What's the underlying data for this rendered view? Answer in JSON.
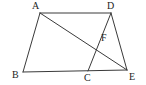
{
  "figure": {
    "width": 146,
    "height": 85,
    "background_color": "#ffffff",
    "stroke_color": "#3a3a3a",
    "label_color": "#232323",
    "stroke_width": 1
  },
  "chart_data": {
    "type": "diagram",
    "title": "",
    "points": [
      {
        "id": "A",
        "label": "A",
        "x": 40,
        "y": 13,
        "label_x": 32,
        "label_y": 1
      },
      {
        "id": "D",
        "label": "D",
        "x": 111,
        "y": 13,
        "label_x": 107,
        "label_y": 1
      },
      {
        "id": "B",
        "label": "B",
        "x": 23,
        "y": 72,
        "label_x": 12,
        "label_y": 70
      },
      {
        "id": "C",
        "label": "C",
        "x": 88,
        "y": 71,
        "label_x": 84,
        "label_y": 73
      },
      {
        "id": "E",
        "label": "E",
        "x": 127,
        "y": 70,
        "label_x": 129,
        "label_y": 72
      },
      {
        "id": "F",
        "label": "F",
        "x": 100,
        "y": 42,
        "label_x": 101,
        "label_y": 33
      }
    ],
    "segments": [
      {
        "name": "AD",
        "from": "A",
        "to": "D"
      },
      {
        "name": "AB",
        "from": "A",
        "to": "B"
      },
      {
        "name": "BE",
        "from": "B",
        "to": "E"
      },
      {
        "name": "AE",
        "from": "A",
        "to": "E"
      },
      {
        "name": "DC",
        "from": "D",
        "to": "C"
      },
      {
        "name": "DE",
        "from": "D",
        "to": "E"
      }
    ],
    "intersections": [
      {
        "label": "F",
        "of": [
          "AE",
          "DC"
        ],
        "x": 100,
        "y": 42
      }
    ]
  }
}
